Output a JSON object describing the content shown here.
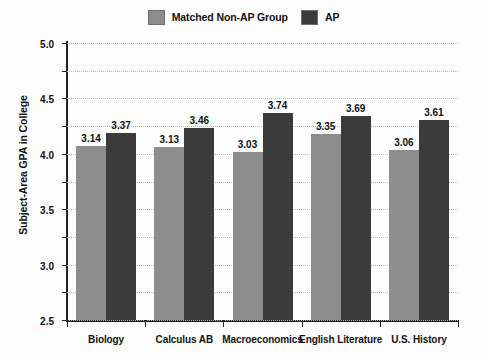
{
  "chart_data": {
    "type": "bar",
    "title": "",
    "xlabel": "",
    "ylabel": "Subject-Area GPA in College",
    "ylim": [
      0.0,
      5.0
    ],
    "ytick_labels": [
      "0.0",
      "0.5",
      "1.0",
      "1.5",
      "2.0",
      "2.5",
      "3.0",
      "3.5",
      "4.0",
      "4.5",
      "5.0"
    ],
    "ytick_values": [
      0.0,
      0.5,
      1.0,
      1.5,
      2.0,
      2.5,
      3.0,
      3.5,
      4.0,
      4.5,
      5.0
    ],
    "grid": true,
    "grid_style": "dotted-horizontal",
    "legend_position": "top-center",
    "categories": [
      "Biology",
      "Calculus AB",
      "Macroeconomics",
      "English Literature",
      "U.S. History"
    ],
    "series": [
      {
        "name": "Matched Non-AP Group",
        "color": "#8d8d8d",
        "values": [
          3.14,
          3.13,
          3.03,
          3.35,
          3.06
        ],
        "labels": [
          "3.14",
          "3.13",
          "3.03",
          "3.35",
          "3.06"
        ]
      },
      {
        "name": "AP",
        "color": "#3b3b3b",
        "values": [
          3.37,
          3.46,
          3.74,
          3.69,
          3.61
        ],
        "labels": [
          "3.37",
          "3.46",
          "3.74",
          "3.69",
          "3.61"
        ]
      }
    ]
  },
  "legend": {
    "entries": [
      {
        "label": "Matched Non-AP Group",
        "swatch_color": "#8d8d8d"
      },
      {
        "label": "AP",
        "swatch_color": "#3b3b3b"
      }
    ]
  },
  "axes": {
    "y_title": "Subject-Area GPA in College"
  }
}
